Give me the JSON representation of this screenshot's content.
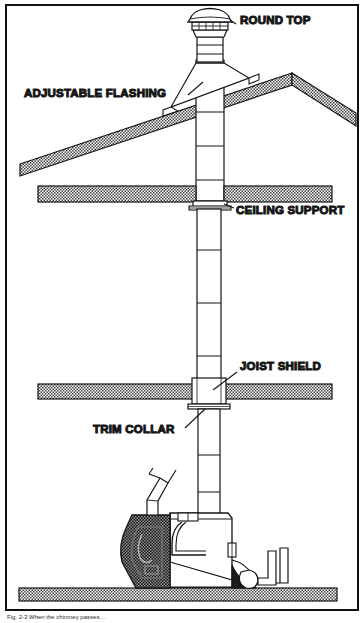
{
  "figure": {
    "border_color": "#111111",
    "background_color": "#ffffff",
    "line_color": "#151515",
    "hatch_color": "#4a4a4a",
    "fill_dark": "#1a1a1a",
    "caption": "Fig. 2-3  When the chimney passes…"
  },
  "labels": {
    "round_top": "ROUND TOP",
    "adjustable_flashing": "ADJUSTABLE FLASHING",
    "ceiling_support": "CEILING SUPPORT",
    "joist_shield": "JOIST SHIELD",
    "trim_collar": "TRIM COLLAR"
  },
  "components": {
    "round_top": "round-top-cap",
    "chimney_pipe": "insulated-chimney-pipe",
    "roof": "pitched-roof-section",
    "flashing": "adjustable-roof-flashing",
    "ceiling": "ceiling-slab",
    "ceiling_support_box": "ceiling-support-box",
    "joist": "floor-joist-slab",
    "joist_shield_box": "joist-shield-box",
    "trim_collar_ring": "trim-collar-ring",
    "floor": "floor-slab",
    "appliance": "wood-stove-boiler-unit",
    "fuel_hopper": "fuel-hopper",
    "feed_pipe": "angled-feed-pipe",
    "drain_trap": "drain-trap-pipe"
  }
}
